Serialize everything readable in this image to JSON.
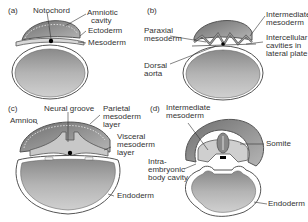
{
  "figure": {
    "colors": {
      "yolk_fill": "#a9a9a9",
      "amnion_fill": "#8e8e8e",
      "mesoderm_fill": "#c8c8c8",
      "outline": "#555555",
      "label_text": "#333333",
      "background": "#ffffff"
    },
    "panels": [
      {
        "id": "a",
        "tag": "(a)",
        "labels": [
          "Notochord",
          "Amniotic cavity",
          "Ectoderm",
          "Mesoderm"
        ]
      },
      {
        "id": "b",
        "tag": "(b)",
        "labels": [
          "Paraxial mesoderm",
          "Intermediate mesoderm",
          "Intercellular cavities in lateral plate",
          "Dorsal aorta"
        ]
      },
      {
        "id": "c",
        "tag": "(c)",
        "labels": [
          "Neural groove",
          "Parietal mesoderm layer",
          "Amnion",
          "Visceral mesoderm layer",
          "Endoderm"
        ]
      },
      {
        "id": "d",
        "tag": "(d)",
        "labels": [
          "Intermediate mesoderm",
          "Somite",
          "Intra-embryonic body cavity",
          "Endoderm"
        ]
      }
    ]
  },
  "text": {
    "a_tag": "(a)",
    "a_notochord": "Notochord",
    "a_amniotic_1": "Amniotic",
    "a_amniotic_2": "cavity",
    "a_ectoderm": "Ectoderm",
    "a_mesoderm": "Mesoderm",
    "b_tag": "(b)",
    "b_paraxial_1": "Paraxial",
    "b_paraxial_2": "mesoderm",
    "b_intermediate_1": "Intermediate",
    "b_intermediate_2": "mesoderm",
    "b_intercellular_1": "Intercellular",
    "b_intercellular_2": "cavities in",
    "b_intercellular_3": "lateral plate",
    "b_dorsal_1": "Dorsal",
    "b_dorsal_2": "aorta",
    "c_tag": "(c)",
    "c_neural": "Neural groove",
    "c_parietal_1": "Parietal",
    "c_parietal_2": "mesoderm",
    "c_parietal_3": "layer",
    "c_amnion": "Amnion",
    "c_visceral_1": "Visceral",
    "c_visceral_2": "mesoderm",
    "c_visceral_3": "layer",
    "c_endoderm": "Endoderm",
    "d_tag": "(d)",
    "d_intermediate_1": "Intermediate",
    "d_intermediate_2": "mesoderm",
    "d_somite": "Somite",
    "d_intra_1": "Intra-",
    "d_intra_2": "embryonic",
    "d_intra_3": "body cavity",
    "d_endoderm": "Endoderm"
  }
}
